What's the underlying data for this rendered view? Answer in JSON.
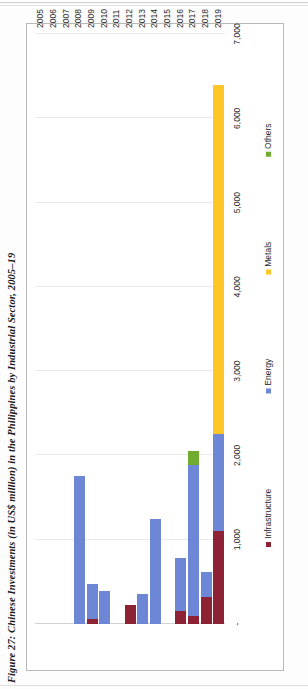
{
  "figure": {
    "title": "Figure 27: Chinese Investments (in US$ million) in the Philippines by Industrial Sector, 2005–19"
  },
  "chart_data": {
    "type": "bar",
    "orientation": "vertical-rotated",
    "stacked": true,
    "title": "Figure 27: Chinese Investments (in US$ million) in the Philippines by Industrial Sector, 2005–19",
    "xlabel": "",
    "ylabel": "",
    "ylim": [
      0,
      7000
    ],
    "yticks": [
      0,
      1000,
      2000,
      3000,
      4000,
      5000,
      6000,
      7000
    ],
    "ytick_labels": [
      "-",
      "1,000",
      "2,000",
      "3,000",
      "4,000",
      "5,000",
      "6,000",
      "7,000"
    ],
    "grid": true,
    "legend_position": "bottom",
    "categories": [
      "2005",
      "2006",
      "2007",
      "2008",
      "2009",
      "2010",
      "2011",
      "2012",
      "2013",
      "2014",
      "2015",
      "2016",
      "2017",
      "2018",
      "2019"
    ],
    "series": [
      {
        "name": "Infrastructure",
        "color": "#8C2233",
        "values": [
          0,
          0,
          0,
          0,
          60,
          0,
          0,
          230,
          0,
          0,
          0,
          160,
          90,
          320,
          1100
        ]
      },
      {
        "name": "Energy",
        "color": "#6E86D6",
        "values": [
          0,
          0,
          0,
          1750,
          420,
          390,
          0,
          0,
          350,
          1250,
          0,
          620,
          1800,
          300,
          1150
        ]
      },
      {
        "name": "Metals",
        "color": "#FFC627",
        "values": [
          0,
          0,
          0,
          0,
          0,
          0,
          0,
          0,
          0,
          0,
          0,
          0,
          0,
          0,
          4150
        ]
      },
      {
        "name": "Others",
        "color": "#70AD2E",
        "values": [
          0,
          0,
          0,
          0,
          0,
          0,
          0,
          0,
          0,
          0,
          0,
          0,
          160,
          0,
          0
        ]
      }
    ],
    "totals": [
      0,
      0,
      0,
      1750,
      480,
      390,
      0,
      230,
      350,
      1250,
      0,
      780,
      2050,
      620,
      6400
    ]
  },
  "legend": {
    "items": [
      {
        "label": "Infrastructure",
        "color": "#8C2233"
      },
      {
        "label": "Energy",
        "color": "#6E86D6"
      },
      {
        "label": "Metals",
        "color": "#FFC627"
      },
      {
        "label": "Others",
        "color": "#70AD2E"
      }
    ]
  },
  "colors": {
    "infrastructure": "#8C2233",
    "energy": "#6E86D6",
    "metals": "#FFC627",
    "others": "#70AD2E",
    "gridline": "#E9E9E9",
    "frame": "#B9B9B9",
    "text": "#2B2B2B"
  }
}
